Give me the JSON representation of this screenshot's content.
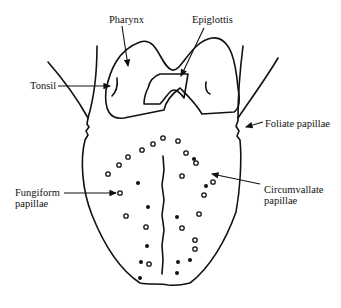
{
  "diagram": {
    "labels": {
      "pharynx": "Pharynx",
      "epiglottis": "Epiglottis",
      "tonsil": "Tonsil",
      "foliate_papillae": "Foliate papillae",
      "fungiform_papillae_line1": "Fungiform",
      "fungiform_papillae_line2": "papillae",
      "circumvallate_papillae_line1": "Circumvallate",
      "circumvallate_papillae_line2": "papillae"
    },
    "colors": {
      "ink": "#111111",
      "background": "#ffffff"
    },
    "papillae": {
      "open": [
        [
          163,
          138
        ],
        [
          153,
          144
        ],
        [
          142,
          150
        ],
        [
          128,
          157
        ],
        [
          119,
          165
        ],
        [
          108,
          174
        ],
        [
          120,
          193
        ],
        [
          126,
          216
        ],
        [
          146,
          227
        ],
        [
          178,
          141
        ],
        [
          186,
          153
        ],
        [
          196,
          163
        ],
        [
          213,
          182
        ],
        [
          182,
          176
        ],
        [
          204,
          195
        ],
        [
          199,
          214
        ],
        [
          182,
          228
        ],
        [
          149,
          264
        ],
        [
          195,
          249
        ],
        [
          195,
          240
        ]
      ],
      "filled": [
        [
          138,
          183
        ],
        [
          148,
          207
        ],
        [
          177,
          217
        ],
        [
          206,
          186
        ],
        [
          141,
          262
        ],
        [
          140,
          278
        ],
        [
          147,
          246
        ],
        [
          178,
          262
        ],
        [
          190,
          260
        ],
        [
          177,
          273
        ],
        [
          194,
          159
        ]
      ]
    }
  }
}
